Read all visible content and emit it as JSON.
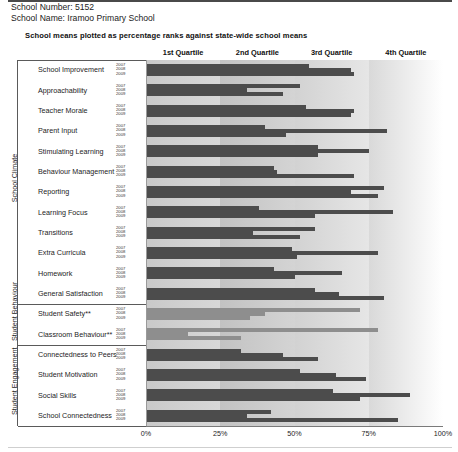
{
  "header": {
    "school_number_line": "School Number: 5152",
    "school_name_line": "School Name: Iramoo Primary School",
    "subtitle": "School means plotted as percentage ranks against state-wide school means"
  },
  "quartiles": [
    "1st Quartile",
    "2nd Quartile",
    "3rd Quartile",
    "4th Quartile"
  ],
  "axis": {
    "ticks": [
      "0%",
      "25%",
      "50%",
      "75%",
      "100%"
    ]
  },
  "years": [
    "2007",
    "2008",
    "2009"
  ],
  "sections": [
    {
      "name": "School Climate"
    },
    {
      "name": "Student Behaviour"
    },
    {
      "name": "Student Engagement"
    }
  ],
  "chart_data": {
    "type": "bar",
    "orientation": "horizontal",
    "title": "School means plotted as percentage ranks against state-wide school means",
    "xlabel": "",
    "ylabel": "",
    "xlim": [
      0,
      100
    ],
    "xticks": [
      0,
      25,
      50,
      75,
      100
    ],
    "grid": false,
    "legend": [
      "2007",
      "2008",
      "2009"
    ],
    "legend_position": "none",
    "bands": [
      {
        "label": "1st Quartile",
        "range": [
          0,
          25
        ]
      },
      {
        "label": "2nd Quartile",
        "range": [
          25,
          50
        ]
      },
      {
        "label": "3rd Quartile",
        "range": [
          50,
          75
        ]
      },
      {
        "label": "4th Quartile",
        "range": [
          75,
          100
        ]
      }
    ],
    "categories": [
      "School Improvement",
      "Approachability",
      "Teacher Morale",
      "Parent Input",
      "Stimulating Learning",
      "Behaviour Management",
      "Reporting",
      "Learning Focus",
      "Transitions",
      "Extra Curricula",
      "Homework",
      "General Satisfaction",
      "Student Safety**",
      "Classroom Behaviour**",
      "Connectedness to Peers",
      "Student Motivation",
      "Social Skills",
      "School Connectedness"
    ],
    "category_sections": [
      "School Climate",
      "School Climate",
      "School Climate",
      "School Climate",
      "School Climate",
      "School Climate",
      "School Climate",
      "School Climate",
      "School Climate",
      "School Climate",
      "School Climate",
      "School Climate",
      "Student Behaviour",
      "Student Behaviour",
      "Student Engagement",
      "Student Engagement",
      "Student Engagement",
      "Student Engagement"
    ],
    "series": [
      {
        "name": "2007",
        "values": [
          55,
          52,
          54,
          40,
          58,
          43,
          80,
          38,
          57,
          49,
          43,
          57,
          72,
          78,
          32,
          52,
          63,
          42
        ]
      },
      {
        "name": "2008",
        "values": [
          69,
          34,
          70,
          81,
          75,
          44,
          69,
          83,
          36,
          78,
          66,
          65,
          40,
          14,
          46,
          64,
          89,
          34
        ]
      },
      {
        "name": "2009",
        "values": [
          70,
          46,
          69,
          47,
          58,
          70,
          78,
          57,
          52,
          51,
          50,
          80,
          35,
          32,
          58,
          74,
          72,
          85
        ]
      }
    ],
    "bar_style": {
      "default_color": "#4c4c4c",
      "light_color": "#8e8e8e",
      "light_rows": [
        "Student Safety**",
        "Classroom Behaviour**"
      ]
    },
    "note": "Rows marked ** use a lighter bar shade."
  }
}
